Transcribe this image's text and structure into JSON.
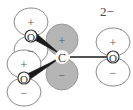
{
  "figure": {
    "overall_charge_label": "2−",
    "background_color": "#ffffff",
    "outline_color": "#8a8a8a",
    "filled_lobe_color": "#b5b5b5",
    "bond_color": "#1a1a1a",
    "label_color": "#333333"
  },
  "atoms": [
    {
      "id": "c-center",
      "label": "C",
      "x": 62,
      "y": 57,
      "lobe_style": "filled",
      "top_lobe_sign": "+",
      "bottom_lobe_sign": "−"
    },
    {
      "id": "o-upper-left",
      "label": "O",
      "x": 31,
      "y": 36,
      "lobe_style": "open",
      "top_lobe_sign": "+",
      "bottom_lobe_sign": "−"
    },
    {
      "id": "o-lower-left",
      "label": "O",
      "x": 24,
      "y": 78,
      "lobe_style": "open",
      "top_lobe_sign": "+",
      "bottom_lobe_sign": "−"
    },
    {
      "id": "o-right",
      "label": "O",
      "x": 113,
      "y": 57,
      "lobe_style": "open",
      "top_lobe_sign": "+",
      "bottom_lobe_sign": "−"
    }
  ],
  "bonds": [
    {
      "id": "bond-c-o-upper-left",
      "from": "c-center",
      "to": "o-upper-left",
      "style": "wedge"
    },
    {
      "id": "bond-c-o-lower-left",
      "from": "c-center",
      "to": "o-lower-left",
      "style": "wedge"
    },
    {
      "id": "bond-c-o-right",
      "from": "c-center",
      "to": "o-right",
      "style": "plain"
    }
  ],
  "lobe_signs": {
    "positive": "+",
    "negative": "−"
  },
  "labels": {
    "carbon": "C",
    "oxygen_upper_left": "O",
    "oxygen_lower_left": "O",
    "oxygen_right": "O",
    "charge": "2−"
  }
}
